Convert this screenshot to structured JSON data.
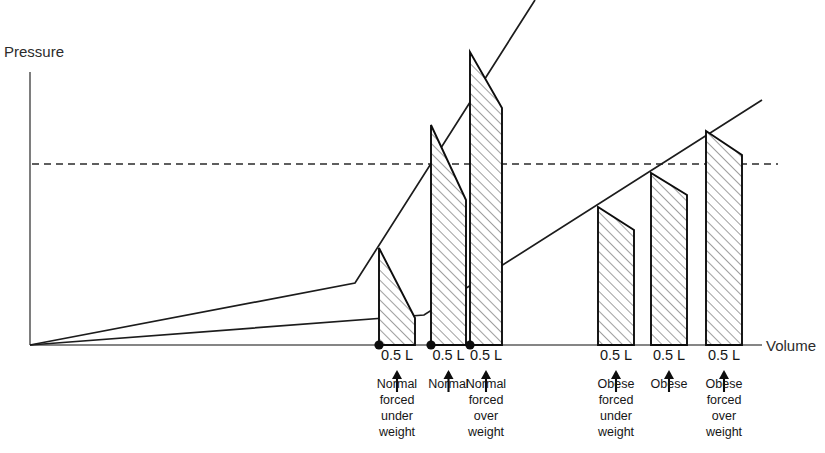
{
  "figure": {
    "axes": {
      "y_label": "Pressure",
      "x_label": "Volume"
    },
    "origin": {
      "x": 30,
      "y": 345
    },
    "y_axis_top": 72,
    "x_axis_end": 762,
    "threshold": {
      "name": "pressure-threshold-line",
      "y": 164,
      "x_start": 32,
      "x_end": 778,
      "style": "dashed"
    },
    "curves": [
      {
        "name": "normal-compliance-curve",
        "description": "steep upper curve",
        "points": [
          [
            30,
            345
          ],
          [
            355,
            283
          ],
          [
            535,
            0
          ]
        ]
      },
      {
        "name": "obese-compliance-curve",
        "description": "shallow lower curve",
        "points": [
          [
            30,
            345
          ],
          [
            424,
            315
          ],
          [
            762,
            100
          ]
        ]
      }
    ],
    "groups": [
      {
        "name": "normal-group",
        "bars": [
          {
            "name": "normal-forced-under-weight-bar",
            "tick_label": "0.5 L",
            "group_label": "Normal\nforced\nunder\nweight",
            "label_lines": [
              "Normal",
              "forced",
              "under",
              "weight"
            ],
            "x_left": 379,
            "x_right": 415,
            "y_top_left": 248,
            "y_top_right": 318,
            "y_bottom": 345,
            "has_marker_dot": true,
            "curve": "normal-compliance-curve"
          },
          {
            "name": "normal-bar",
            "tick_label": "0.5 L",
            "group_label": "Normal",
            "label_lines": [
              "Normal"
            ],
            "x_left": 431,
            "x_right": 466,
            "y_top_left": 125,
            "y_top_right": 200,
            "y_bottom": 345,
            "has_marker_dot": true,
            "curve": "normal-compliance-curve"
          },
          {
            "name": "normal-forced-over-weight-bar",
            "tick_label": "0.5 L",
            "group_label": "Normal\nforced\nover\nweight",
            "label_lines": [
              "Normal",
              "forced",
              "over",
              "weight"
            ],
            "x_left": 470,
            "x_right": 502,
            "y_top_left": 52,
            "y_top_right": 108,
            "y_bottom": 345,
            "has_marker_dot": true,
            "curve": "normal-compliance-curve"
          }
        ]
      },
      {
        "name": "obese-group",
        "bars": [
          {
            "name": "obese-forced-under-weight-bar",
            "tick_label": "0.5 L",
            "group_label": "Obese\nforced\nunder\nweight",
            "label_lines": [
              "Obese",
              "forced",
              "under",
              "weight"
            ],
            "x_left": 598,
            "x_right": 634,
            "y_top_left": 207,
            "y_top_right": 230,
            "y_bottom": 345,
            "has_marker_dot": false,
            "curve": "obese-compliance-curve"
          },
          {
            "name": "obese-bar",
            "tick_label": "0.5 L",
            "group_label": "Obese",
            "label_lines": [
              "Obese"
            ],
            "x_left": 651,
            "x_right": 687,
            "y_top_left": 173,
            "y_top_right": 195,
            "y_bottom": 345,
            "has_marker_dot": false,
            "curve": "obese-compliance-curve"
          },
          {
            "name": "obese-forced-over-weight-bar",
            "tick_label": "0.5 L",
            "group_label": "Obese\nforced\nover\nweight",
            "label_lines": [
              "Obese",
              "forced",
              "over",
              "weight"
            ],
            "x_left": 706,
            "x_right": 742,
            "y_top_left": 131,
            "y_top_right": 155,
            "y_bottom": 345,
            "has_marker_dot": false,
            "curve": "obese-compliance-curve"
          }
        ]
      }
    ],
    "colors": {
      "curve": "#1c1c1c",
      "axis": "#5d5d5d",
      "bar_outline": "#0d0d0d",
      "hatch": "#8c8c8c",
      "text": "#161616",
      "background": "#ffffff"
    }
  },
  "chart_data": {
    "type": "line",
    "title": "",
    "xlabel": "Volume",
    "ylabel": "Pressure",
    "grid": false,
    "legend": "none",
    "annotations": [
      "0.5 L",
      "Normal forced under weight",
      "0.5 L",
      "Normal",
      "0.5 L",
      "Normal forced over weight",
      "0.5 L",
      "Obese forced under weight",
      "0.5 L",
      "Obese",
      "0.5 L",
      "Obese forced over weight"
    ],
    "series": [
      {
        "name": "Normal compliance curve",
        "x": [
          0,
          0.44,
          0.69
        ],
        "y": [
          0,
          0.23,
          1.26
        ]
      },
      {
        "name": "Obese compliance curve",
        "x": [
          0,
          0.54,
          1.0
        ],
        "y": [
          0,
          0.11,
          0.9
        ]
      }
    ],
    "tidal_volume_segments": [
      {
        "label": "Normal forced under weight",
        "volume_L": 0.5,
        "curve": "Normal compliance curve"
      },
      {
        "label": "Normal",
        "volume_L": 0.5,
        "curve": "Normal compliance curve"
      },
      {
        "label": "Normal forced over weight",
        "volume_L": 0.5,
        "curve": "Normal compliance curve"
      },
      {
        "label": "Obese forced under weight",
        "volume_L": 0.5,
        "curve": "Obese compliance curve"
      },
      {
        "label": "Obese",
        "volume_L": 0.5,
        "curve": "Obese compliance curve"
      },
      {
        "label": "Obese forced over weight",
        "volume_L": 0.5,
        "curve": "Obese compliance curve"
      }
    ]
  }
}
